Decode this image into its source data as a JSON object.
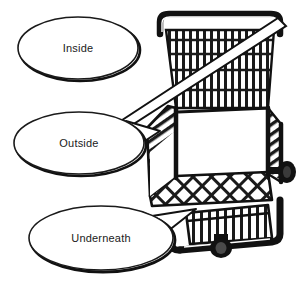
{
  "figure": {
    "kind": "line-illustration",
    "background_color": "#ffffff",
    "ink_color": "#111111",
    "line_color": "#1a1a1a"
  },
  "callouts": [
    {
      "id": "inside",
      "label": "Inside",
      "shape": "ellipse",
      "cx": 78,
      "cy": 48,
      "rx": 60,
      "ry": 31,
      "has_pointer": false,
      "points_to": "basket-interior"
    },
    {
      "id": "outside",
      "label": "Outside",
      "shape": "ellipse",
      "cx": 79,
      "cy": 143,
      "rx": 65,
      "ry": 31,
      "has_pointer": true,
      "points_to": "basket-outer-mesh"
    },
    {
      "id": "underneath",
      "label": "Underneath",
      "shape": "ellipse",
      "cx": 101,
      "cy": 238,
      "rx": 72,
      "ry": 32,
      "has_pointer": true,
      "points_to": "lower-rack"
    }
  ],
  "cart_parts": [
    {
      "id": "handle",
      "label": "handle-bar"
    },
    {
      "id": "basket-upper",
      "label": "upper-basket-grid"
    },
    {
      "id": "basket-lower",
      "label": "lower-basket-lattice"
    },
    {
      "id": "lower-rack",
      "label": "under-basket-rack"
    },
    {
      "id": "rear-wheel",
      "label": "rear-caster-wheel"
    },
    {
      "id": "front-wheel",
      "label": "front-caster-wheel"
    },
    {
      "id": "frame",
      "label": "cart-frame"
    }
  ]
}
